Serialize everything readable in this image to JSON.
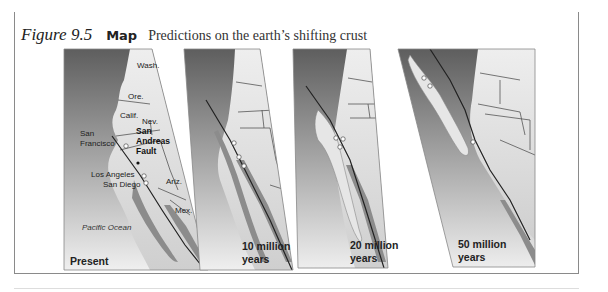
{
  "figure": {
    "number_label": "Figure 9.5",
    "type_label": "Map",
    "title": "Predictions on the earth’s shifting crust"
  },
  "panels": [
    {
      "label": "Present",
      "places": {
        "wash": "Wash.",
        "ore": "Ore.",
        "calif": "Calif.",
        "nev": "Nev.",
        "ariz": "Ariz.",
        "mex": "Mex.",
        "sf_line1": "San",
        "sf_line2": "Francisco",
        "fault_line1": "San",
        "fault_line2": "Andreas",
        "fault_line3": "Fault",
        "la": "Los Angeles",
        "sd": "San Diego",
        "ocean": "Pacific Ocean"
      }
    },
    {
      "label_line1": "10 million",
      "label_line2": "years"
    },
    {
      "label_line1": "20 million",
      "label_line2": "years"
    },
    {
      "label_line1": "50 million",
      "label_line2": "years"
    }
  ],
  "colors": {
    "header_bar": "#5a5a5a",
    "ocean_dark": "#5e5e5e",
    "ocean_light": "#f0f0f0",
    "land": "#dcdcdc",
    "drifting_plate": "#8c8c8c",
    "fault_line": "#222222"
  }
}
